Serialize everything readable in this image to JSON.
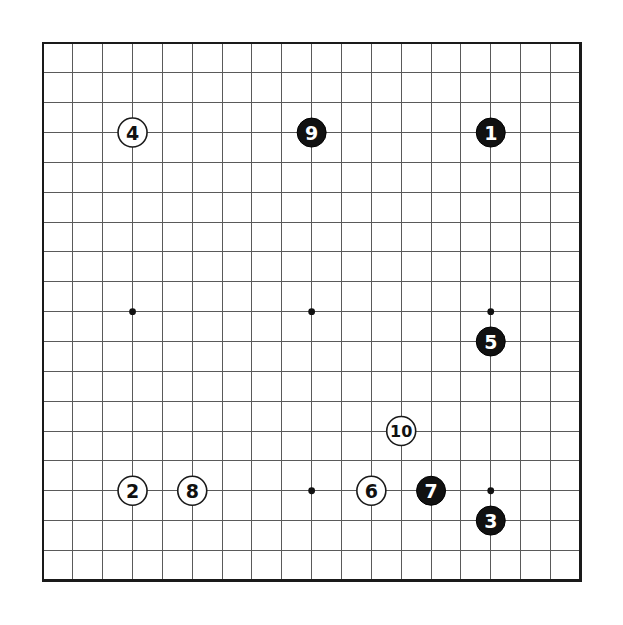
{
  "diagram": {
    "type": "go-board-diagram",
    "board_size": 19,
    "background_color": "#ffffff",
    "grid_color": "#5a5a5a",
    "border_color": "#1a1a1a",
    "black_stone_color": "#111111",
    "white_stone_color": "#ffffff",
    "geometry": {
      "origin_x": 43,
      "origin_y": 43,
      "spacing": 29.85,
      "stone_radius": 14.5,
      "star_radius": 3.4,
      "label_font_size": 19
    },
    "star_points": [
      {
        "col": 3,
        "row": 3
      },
      {
        "col": 9,
        "row": 3
      },
      {
        "col": 15,
        "row": 3
      },
      {
        "col": 3,
        "row": 9
      },
      {
        "col": 9,
        "row": 9
      },
      {
        "col": 15,
        "row": 9
      },
      {
        "col": 3,
        "row": 15
      },
      {
        "col": 9,
        "row": 15
      },
      {
        "col": 15,
        "row": 15
      }
    ],
    "stones": [
      {
        "label": "1",
        "color": "black",
        "col": 15,
        "row": 3
      },
      {
        "label": "2",
        "color": "white",
        "col": 3,
        "row": 15
      },
      {
        "label": "3",
        "color": "black",
        "col": 15,
        "row": 16
      },
      {
        "label": "4",
        "color": "white",
        "col": 3,
        "row": 3
      },
      {
        "label": "5",
        "color": "black",
        "col": 15,
        "row": 10
      },
      {
        "label": "6",
        "color": "white",
        "col": 11,
        "row": 15
      },
      {
        "label": "7",
        "color": "black",
        "col": 13,
        "row": 15
      },
      {
        "label": "8",
        "color": "white",
        "col": 5,
        "row": 15
      },
      {
        "label": "9",
        "color": "black",
        "col": 9,
        "row": 3
      },
      {
        "label": "10",
        "color": "white",
        "col": 12,
        "row": 13
      }
    ]
  }
}
